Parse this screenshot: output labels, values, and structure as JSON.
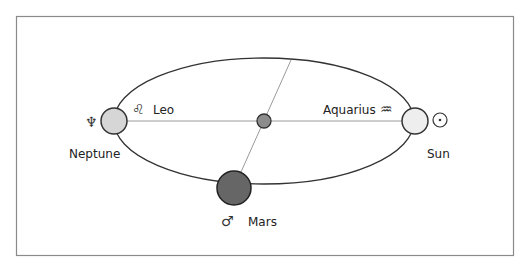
{
  "diagram": {
    "frame": {
      "x": 16,
      "y": 16,
      "w": 498,
      "h": 240,
      "stroke": "#8a8a8a"
    },
    "orbit": {
      "cx": 264,
      "cy": 121,
      "rx": 150,
      "ry": 63,
      "stroke": "#333333"
    },
    "axis_lines": [
      {
        "name": "horizontal-axis",
        "x1": 127,
        "y1": 121,
        "x2": 402,
        "y2": 121,
        "stroke": "#999999"
      },
      {
        "name": "diagonal-axis",
        "x1": 291,
        "y1": 60,
        "x2": 241,
        "y2": 172,
        "stroke": "#999999"
      }
    ],
    "bodies": [
      {
        "id": "neptune",
        "label": "Neptune",
        "symbol": "♆",
        "cx": 114,
        "cy": 121,
        "r": 13,
        "fill": "#d6d6d6"
      },
      {
        "id": "sun",
        "label": "Sun",
        "symbol": "☉",
        "cx": 415,
        "cy": 121,
        "r": 13,
        "fill": "#eeeeee"
      },
      {
        "id": "mars",
        "label": "Mars",
        "symbol": "♂",
        "cx": 234,
        "cy": 188,
        "r": 17,
        "fill": "#666666"
      },
      {
        "id": "center",
        "label": "",
        "symbol": "",
        "cx": 264,
        "cy": 121,
        "r": 7,
        "fill": "#8c8c8c"
      }
    ],
    "zodiac": [
      {
        "id": "leo",
        "label": "Leo",
        "symbol": "♌"
      },
      {
        "id": "aquarius",
        "label": "Aquarius",
        "symbol": "♒"
      }
    ]
  }
}
